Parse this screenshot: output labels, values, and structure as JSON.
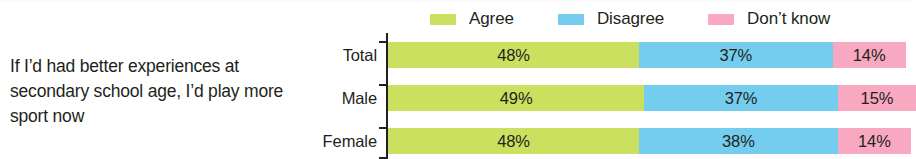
{
  "figure": {
    "question": "If I’d had better experiences at secondary school age, I’d play more sport now"
  },
  "colors": {
    "agree": "#cbe05f",
    "disagree": "#74cdee",
    "dont_know": "#f9a8c1",
    "text": "#231f20",
    "axis": "#231f20",
    "background": "#ffffff"
  },
  "chart_data": {
    "type": "bar",
    "orientation": "horizontal",
    "stacked": true,
    "stacked_normalized": true,
    "title": "If I’d had better experiences at secondary school age, I’d play more sport now",
    "xlabel": "",
    "ylabel": "",
    "xlim": [
      0,
      100
    ],
    "grid": false,
    "legend_position": "top-right",
    "value_suffix": "%",
    "categories": [
      "Total",
      "Male",
      "Female"
    ],
    "series": [
      {
        "name": "Agree",
        "color": "#cbe05f",
        "values": [
          48,
          49,
          48
        ],
        "labels": [
          "48%",
          "49%",
          "48%"
        ]
      },
      {
        "name": "Disagree",
        "color": "#74cdee",
        "values": [
          37,
          37,
          38
        ],
        "labels": [
          "37%",
          "37%",
          "38%"
        ]
      },
      {
        "name": "Don’t know",
        "color": "#f9a8c1",
        "values": [
          14,
          15,
          14
        ],
        "labels": [
          "14%",
          "15%",
          "14%"
        ]
      }
    ],
    "legend": [
      "Agree",
      "Disagree",
      "Don’t know"
    ],
    "rows": [
      {
        "category": "Total",
        "agree": "48%",
        "disagree": "37%",
        "dont_know": "14%"
      },
      {
        "category": "Male",
        "agree": "49%",
        "disagree": "37%",
        "dont_know": "15%"
      },
      {
        "category": "Female",
        "agree": "48%",
        "disagree": "38%",
        "dont_know": "14%"
      }
    ]
  }
}
